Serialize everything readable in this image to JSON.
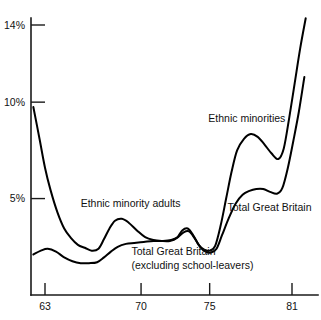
{
  "chart_data": {
    "type": "line",
    "title": "",
    "subtitle": "",
    "xlabel": "",
    "ylabel": "",
    "grid": false,
    "legend_position": "inline-annotations",
    "xlim": [
      62.0,
      82.3
    ],
    "ylim": [
      0.0,
      14.6
    ],
    "x_ticks": [
      63,
      70,
      75,
      81
    ],
    "x_tick_labels": [
      "63",
      "70",
      "75",
      "81"
    ],
    "y_ticks": [
      5,
      10,
      14
    ],
    "y_tick_labels": [
      "5%",
      "10%",
      "14%"
    ],
    "annotations": [
      {
        "name": "ethnic-minority-adults",
        "text": "Ethnic minority adults",
        "x": 65.6,
        "y": 4.55
      },
      {
        "name": "ethnic-minorities",
        "text": "Ethnic minorities",
        "x": 74.9,
        "y": 8.95
      },
      {
        "name": "total-great-britain",
        "text": "Total Great Britain",
        "x": 76.3,
        "y": 4.35
      },
      {
        "name": "total-great-britain-excluding-line1",
        "text": "Total Great Britain",
        "x": 69.3,
        "y": 2.05
      },
      {
        "name": "total-great-britain-excluding-line2",
        "text": "(excluding school-leavers)",
        "x": 69.3,
        "y": 1.35
      }
    ],
    "series": [
      {
        "name": "Ethnic minorities",
        "label": "Ethnic minorities",
        "points": [
          [
            62.15,
            9.75
          ],
          [
            62.6,
            8.1
          ],
          [
            63.0,
            6.6
          ],
          [
            63.4,
            5.45
          ],
          [
            63.9,
            4.3
          ],
          [
            64.4,
            3.45
          ],
          [
            64.9,
            2.95
          ],
          [
            65.4,
            2.6
          ],
          [
            65.9,
            2.45
          ],
          [
            66.4,
            2.3
          ],
          [
            66.9,
            2.4
          ],
          [
            67.3,
            2.9
          ],
          [
            67.7,
            3.45
          ],
          [
            68.1,
            3.85
          ],
          [
            68.6,
            3.95
          ],
          [
            69.1,
            3.75
          ],
          [
            69.7,
            3.35
          ],
          [
            70.3,
            3.0
          ],
          [
            70.9,
            2.85
          ],
          [
            71.5,
            2.8
          ],
          [
            72.1,
            2.8
          ],
          [
            72.6,
            2.95
          ],
          [
            73.0,
            3.35
          ],
          [
            73.4,
            3.45
          ],
          [
            73.8,
            3.1
          ],
          [
            74.2,
            2.6
          ],
          [
            74.6,
            2.35
          ],
          [
            75.0,
            2.3
          ],
          [
            75.4,
            2.55
          ],
          [
            75.8,
            3.6
          ],
          [
            76.2,
            5.0
          ],
          [
            76.6,
            6.4
          ],
          [
            77.0,
            7.5
          ],
          [
            77.5,
            8.1
          ],
          [
            78.0,
            8.35
          ],
          [
            78.5,
            8.2
          ],
          [
            79.0,
            7.8
          ],
          [
            79.5,
            7.35
          ],
          [
            80.0,
            7.05
          ],
          [
            80.4,
            7.6
          ],
          [
            80.8,
            9.2
          ],
          [
            81.2,
            11.0
          ],
          [
            81.6,
            12.8
          ],
          [
            82.0,
            14.35
          ]
        ]
      },
      {
        "name": "Total Great Britain (excluding school-leavers)",
        "label": "Total Great Britain",
        "points": [
          [
            62.15,
            2.1
          ],
          [
            62.7,
            2.3
          ],
          [
            63.2,
            2.4
          ],
          [
            63.8,
            2.25
          ],
          [
            64.4,
            1.95
          ],
          [
            65.0,
            1.75
          ],
          [
            65.6,
            1.65
          ],
          [
            66.2,
            1.65
          ],
          [
            66.8,
            1.7
          ],
          [
            67.3,
            1.95
          ],
          [
            67.8,
            2.25
          ],
          [
            68.3,
            2.5
          ],
          [
            68.9,
            2.65
          ],
          [
            69.5,
            2.7
          ],
          [
            70.2,
            2.75
          ],
          [
            70.9,
            2.8
          ],
          [
            71.6,
            2.8
          ],
          [
            72.2,
            2.85
          ],
          [
            72.7,
            3.0
          ],
          [
            73.1,
            3.25
          ],
          [
            73.5,
            3.3
          ],
          [
            73.9,
            2.95
          ],
          [
            74.3,
            2.5
          ],
          [
            74.7,
            2.25
          ],
          [
            75.1,
            2.2
          ],
          [
            75.5,
            2.4
          ],
          [
            75.9,
            3.1
          ],
          [
            76.4,
            4.0
          ],
          [
            76.9,
            4.75
          ],
          [
            77.4,
            5.2
          ],
          [
            77.9,
            5.4
          ],
          [
            78.4,
            5.5
          ],
          [
            78.9,
            5.5
          ],
          [
            79.4,
            5.35
          ],
          [
            79.9,
            5.25
          ],
          [
            80.3,
            5.55
          ],
          [
            80.7,
            6.6
          ],
          [
            81.1,
            8.0
          ],
          [
            81.5,
            9.5
          ],
          [
            81.9,
            11.3
          ]
        ]
      }
    ]
  }
}
